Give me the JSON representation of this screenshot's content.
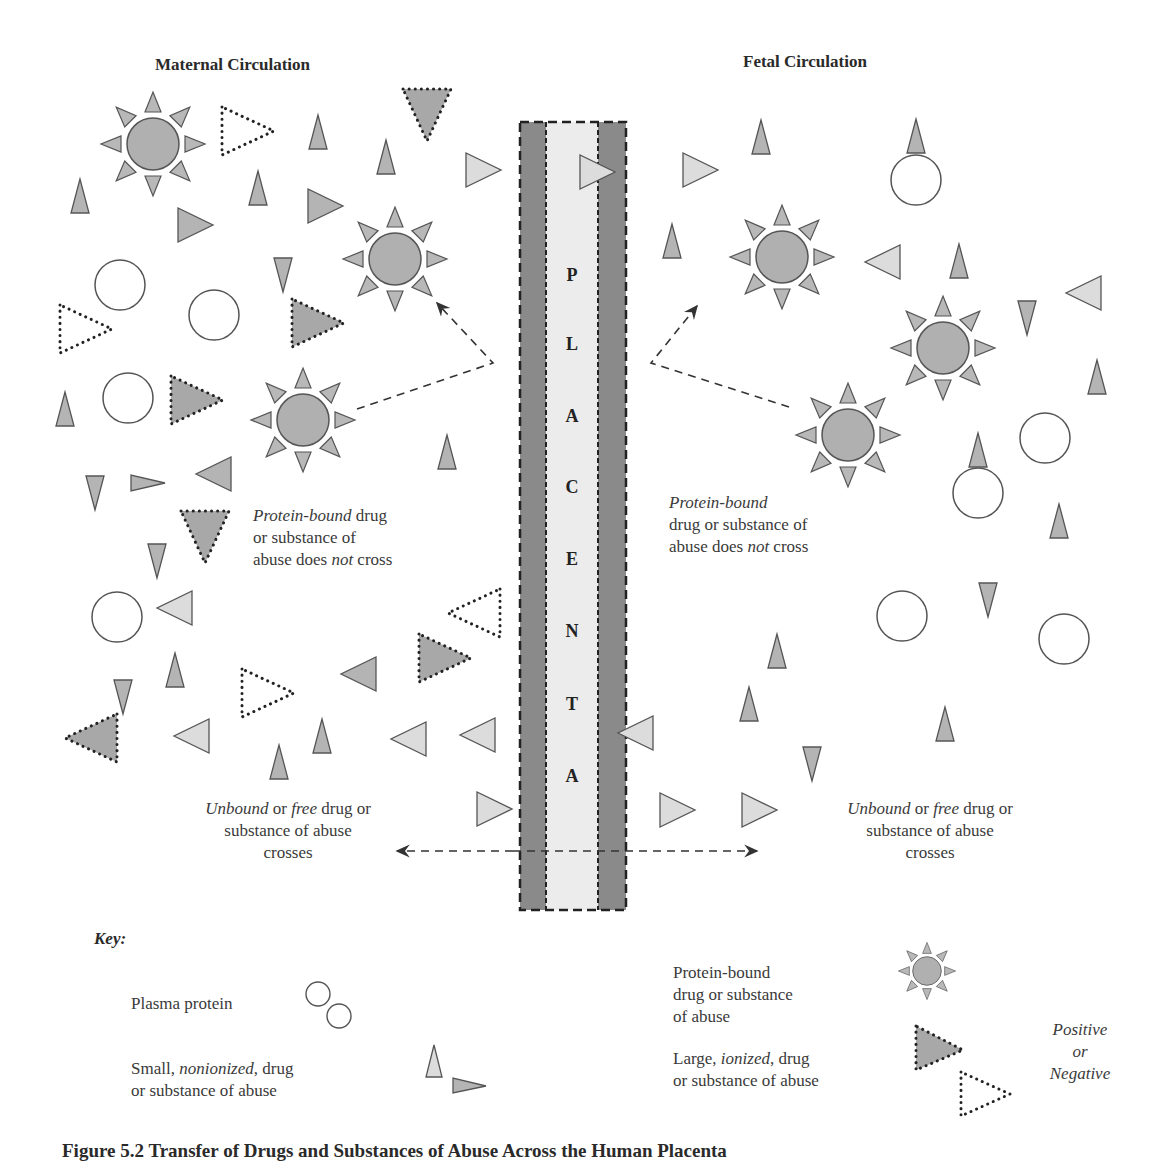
{
  "headers": {
    "maternal": "Maternal Circulation",
    "fetal": "Fetal Circulation"
  },
  "placenta": {
    "letters": [
      "P",
      "L",
      "A",
      "C",
      "E",
      "N",
      "T",
      "A"
    ]
  },
  "annotations": {
    "maternal_bound": {
      "line1_italic": "Protein-bound",
      "line1_rest": " drug",
      "line2": "or substance of",
      "line3_a": "abuse does ",
      "line3_italic": "not",
      "line3_b": " cross"
    },
    "fetal_bound": {
      "line1_italic": "Protein-bound",
      "line2": "drug or substance of",
      "line3_a": "abuse does ",
      "line3_italic": "not",
      "line3_b": " cross"
    },
    "maternal_free": {
      "w1_italic": "Unbound",
      "w2": " or ",
      "w3_italic": "free",
      "w4": " drug or",
      "line2": "substance of abuse",
      "line3": "crosses"
    },
    "fetal_free": {
      "w1_italic": "Unbound",
      "w2": " or ",
      "w3_italic": "free",
      "w4": " drug or",
      "line2": "substance of abuse",
      "line3": "crosses"
    }
  },
  "key": {
    "title": "Key:",
    "plasma_protein": "Plasma protein",
    "small_a": "Small, ",
    "small_italic": "nonionized",
    "small_b": ", drug",
    "small_line2": "or substance of abuse",
    "bound_line1": "Protein-bound",
    "bound_line2": "drug or substance",
    "bound_line3": "of abuse",
    "large_a": "Large, ",
    "large_italic": "ionized",
    "large_b": ", drug",
    "large_line2": "or substance of abuse",
    "charge_line1": "Positive",
    "charge_line2": "or",
    "charge_line3": "Negative"
  },
  "caption": "Figure 5.2   Transfer of Drugs and Substances of Abuse Across the Human Placenta",
  "colors": {
    "placenta_dark": "#8a8a8a",
    "placenta_light": "#ececec",
    "shape_mid": "#b4b4b4",
    "shape_light": "#dcdcdc",
    "outline": "#555555"
  }
}
